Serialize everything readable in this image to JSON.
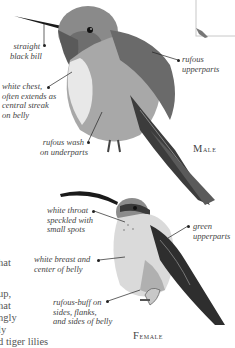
{
  "page": {
    "type": "field-guide-plate"
  },
  "male": {
    "caption": "Male",
    "annotations": [
      {
        "id": "bill",
        "lines": [
          "straight",
          "black bill"
        ]
      },
      {
        "id": "upperparts",
        "lines": [
          "rufous",
          "upperparts"
        ]
      },
      {
        "id": "chest",
        "lines": [
          "white chest,",
          "often extends as",
          "central streak",
          "on belly"
        ]
      },
      {
        "id": "wash",
        "lines": [
          "rufous wash",
          "on underparts"
        ]
      }
    ]
  },
  "female": {
    "caption": "Female",
    "annotations": [
      {
        "id": "throat",
        "lines": [
          "white throat",
          "speckled with",
          "small spots"
        ]
      },
      {
        "id": "upperparts",
        "lines": [
          "green",
          "upperparts"
        ]
      },
      {
        "id": "breast",
        "lines": [
          "white breast and",
          "center of belly"
        ]
      },
      {
        "id": "sides",
        "lines": [
          "rufous-buff on",
          "sides, flanks,",
          "and sides of belly"
        ]
      }
    ]
  },
  "body_text_fragments": [
    "hat",
    "up,",
    "hat",
    "ngly",
    "ly",
    "d tiger lilies"
  ]
}
